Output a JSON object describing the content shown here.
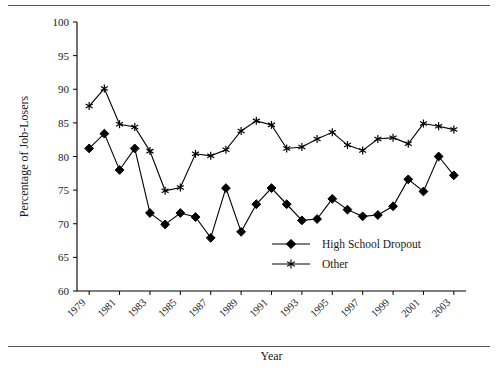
{
  "figure": {
    "background": "#ffffff",
    "ink_color": "#000000",
    "has_top_rule": true,
    "has_bottom_rule": true
  },
  "chart_data": {
    "type": "line",
    "title": "",
    "xlabel": "Year",
    "ylabel": "Percentage of Job-Losers",
    "xlim": [
      1978.2,
      2003.8
    ],
    "ylim": [
      60,
      100
    ],
    "yticks": [
      60,
      65,
      70,
      75,
      80,
      85,
      90,
      95,
      100
    ],
    "ytick_labels": [
      "60",
      "65",
      "70",
      "75",
      "80",
      "85",
      "90",
      "95",
      "100"
    ],
    "xticks": [
      1979,
      1981,
      1983,
      1985,
      1987,
      1989,
      1991,
      1993,
      1995,
      1997,
      1999,
      2001,
      2003
    ],
    "xtick_labels": [
      "1979",
      "1981",
      "1983",
      "1985",
      "1987",
      "1989",
      "1991",
      "1993",
      "1995",
      "1997",
      "1999",
      "2001",
      "2003"
    ],
    "grid": false,
    "legend_position": "lower-right-inside",
    "x": [
      1979,
      1980,
      1981,
      1982,
      1983,
      1984,
      1985,
      1986,
      1987,
      1988,
      1989,
      1990,
      1991,
      1992,
      1993,
      1994,
      1995,
      1996,
      1997,
      1998,
      1999,
      2000,
      2001,
      2002,
      2003
    ],
    "series": [
      {
        "name": "High School Dropout",
        "marker": "diamond",
        "values": [
          81.2,
          83.4,
          78.0,
          81.2,
          71.6,
          69.9,
          71.6,
          71.0,
          67.9,
          75.3,
          68.8,
          72.9,
          75.3,
          72.9,
          70.5,
          70.7,
          73.7,
          72.1,
          71.1,
          71.3,
          72.6,
          76.6,
          74.8,
          80.0,
          77.2
        ]
      },
      {
        "name": "Other",
        "marker": "asterisk",
        "values": [
          87.5,
          90.1,
          84.8,
          84.4,
          80.8,
          74.9,
          75.4,
          80.4,
          80.1,
          81.0,
          83.8,
          85.3,
          84.7,
          81.2,
          81.4,
          82.6,
          83.6,
          81.7,
          80.9,
          82.6,
          82.8,
          81.9,
          84.9,
          84.5,
          84.0
        ]
      }
    ]
  },
  "legend": {
    "entries": [
      {
        "label": "High School Dropout",
        "marker": "diamond"
      },
      {
        "label": "Other",
        "marker": "asterisk"
      }
    ]
  }
}
